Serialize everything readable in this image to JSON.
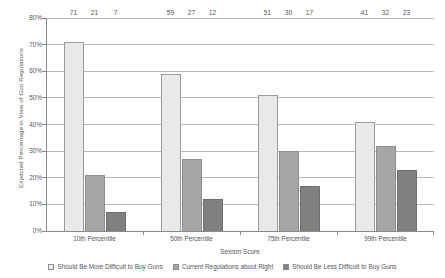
{
  "chart_data": {
    "type": "bar",
    "title": "",
    "subtitle": "",
    "xlabel": "Sexism Score",
    "ylabel": "Expected Percentage in View of Gun Regulations",
    "categories": [
      "10th Percentile",
      "50th Percentile",
      "75th Percentile",
      "99th Percentile"
    ],
    "series": [
      {
        "name": "Should Be More Difficult to Buy Guns",
        "color": "#e9e9e9",
        "values": [
          71,
          59,
          51,
          41
        ]
      },
      {
        "name": "Current Regulations about Right",
        "color": "#a6a6a6",
        "values": [
          21,
          27,
          30,
          32
        ]
      },
      {
        "name": "Should Be Less  Difficult to Buy Guns",
        "color": "#808080",
        "values": [
          7,
          12,
          17,
          23
        ]
      }
    ],
    "ylim": [
      0,
      80
    ],
    "ytick_labels": [
      "0%",
      "10%",
      "20%",
      "30%",
      "40%",
      "50%",
      "60%",
      "70%",
      "80%"
    ],
    "ytick_values": [
      0,
      10,
      20,
      30,
      40,
      50,
      60,
      70,
      80
    ],
    "grid": true,
    "legend_position": "bottom"
  }
}
